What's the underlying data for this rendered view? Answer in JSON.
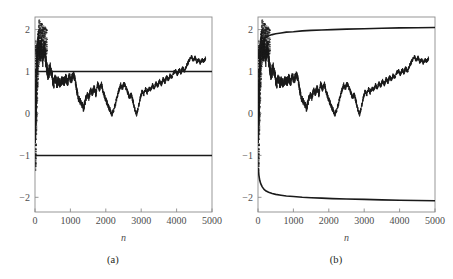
{
  "figure": {
    "background_color": "#ffffff",
    "panels": [
      {
        "id": "a",
        "caption": "(a)"
      },
      {
        "id": "b",
        "caption": "(b)"
      }
    ]
  },
  "chart_data": [
    {
      "type": "line",
      "panel": "a",
      "title": "",
      "xlabel": "n",
      "ylabel": "",
      "xlim": [
        0,
        5000
      ],
      "ylim": [
        -2.35,
        2.3
      ],
      "xticks": [
        0,
        1000,
        2000,
        3000,
        4000,
        5000
      ],
      "xticklabels": [
        "0",
        "1000",
        "2000",
        "3000",
        "4000",
        "5000"
      ],
      "yticks": [
        -2,
        -1,
        0,
        1,
        2
      ],
      "yticklabels": [
        "-2",
        "-1",
        "0",
        "1",
        "2"
      ],
      "grid": false,
      "legend": null,
      "series": [
        {
          "name": "sample-path",
          "style": "noisy-walk",
          "color": "#1a1a1a",
          "x": [
            10,
            30,
            60,
            100,
            140,
            180,
            220,
            260,
            300,
            340,
            380,
            420,
            470,
            520,
            570,
            620,
            670,
            720,
            770,
            820,
            870,
            920,
            970,
            1020,
            1070,
            1120,
            1170,
            1220,
            1270,
            1320,
            1370,
            1420,
            1470,
            1520,
            1570,
            1620,
            1670,
            1720,
            1770,
            1820,
            1870,
            1920,
            1970,
            2020,
            2070,
            2120,
            2170,
            2220,
            2270,
            2320,
            2370,
            2420,
            2470,
            2520,
            2570,
            2620,
            2670,
            2720,
            2770,
            2820,
            2870,
            2920,
            2970,
            3020,
            3070,
            3120,
            3170,
            3220,
            3270,
            3320,
            3370,
            3420,
            3470,
            3520,
            3570,
            3620,
            3670,
            3720,
            3770,
            3820,
            3870,
            3920,
            3970,
            4020,
            4070,
            4120,
            4170,
            4220,
            4270,
            4320,
            4370,
            4420,
            4470,
            4520,
            4570,
            4620,
            4670,
            4720,
            4770,
            4820
          ],
          "y": [
            0.05,
            0.55,
            1.35,
            1.72,
            1.45,
            1.62,
            1.28,
            1.55,
            1.3,
            1.05,
            0.88,
            1.12,
            0.95,
            0.7,
            0.8,
            0.72,
            0.78,
            0.7,
            0.82,
            0.75,
            0.86,
            0.74,
            0.9,
            0.78,
            0.92,
            0.86,
            0.6,
            0.38,
            0.3,
            0.22,
            0.12,
            0.3,
            0.45,
            0.38,
            0.55,
            0.48,
            0.62,
            0.45,
            0.7,
            0.58,
            0.72,
            0.55,
            0.4,
            0.28,
            0.18,
            0.08,
            -0.02,
            0.06,
            0.22,
            0.4,
            0.55,
            0.68,
            0.6,
            0.72,
            0.62,
            0.5,
            0.38,
            0.45,
            0.28,
            0.1,
            -0.02,
            0.15,
            0.35,
            0.52,
            0.45,
            0.58,
            0.5,
            0.62,
            0.55,
            0.68,
            0.6,
            0.72,
            0.65,
            0.78,
            0.7,
            0.82,
            0.75,
            0.88,
            0.8,
            0.92,
            0.85,
            0.98,
            1.02,
            0.92,
            1.05,
            0.96,
            1.08,
            1.0,
            1.12,
            1.2,
            1.28,
            1.35,
            1.26,
            1.34,
            1.22,
            1.3,
            1.2,
            1.28,
            1.24,
            1.32
          ]
        },
        {
          "name": "upper-bound-line",
          "style": "horizontal",
          "value": 1.0,
          "color": "#1a1a1a"
        },
        {
          "name": "lower-bound-line",
          "style": "horizontal",
          "value": -1.0,
          "color": "#1a1a1a"
        }
      ]
    },
    {
      "type": "line",
      "panel": "b",
      "title": "",
      "xlabel": "n",
      "ylabel": "",
      "xlim": [
        0,
        5000
      ],
      "ylim": [
        -2.35,
        2.3
      ],
      "xticks": [
        0,
        1000,
        2000,
        3000,
        4000,
        5000
      ],
      "xticklabels": [
        "0",
        "1000",
        "2000",
        "3000",
        "4000",
        "5000"
      ],
      "yticks": [
        -2,
        -1,
        0,
        1,
        2
      ],
      "yticklabels": [
        "-2",
        "-1",
        "0",
        "1",
        "2"
      ],
      "grid": false,
      "legend": null,
      "series": [
        {
          "name": "sample-path",
          "style": "noisy-walk",
          "color": "#1a1a1a",
          "x": [
            10,
            30,
            60,
            100,
            140,
            180,
            220,
            260,
            300,
            340,
            380,
            420,
            470,
            520,
            570,
            620,
            670,
            720,
            770,
            820,
            870,
            920,
            970,
            1020,
            1070,
            1120,
            1170,
            1220,
            1270,
            1320,
            1370,
            1420,
            1470,
            1520,
            1570,
            1620,
            1670,
            1720,
            1770,
            1820,
            1870,
            1920,
            1970,
            2020,
            2070,
            2120,
            2170,
            2220,
            2270,
            2320,
            2370,
            2420,
            2470,
            2520,
            2570,
            2620,
            2670,
            2720,
            2770,
            2820,
            2870,
            2920,
            2970,
            3020,
            3070,
            3120,
            3170,
            3220,
            3270,
            3320,
            3370,
            3420,
            3470,
            3520,
            3570,
            3620,
            3670,
            3720,
            3770,
            3820,
            3870,
            3920,
            3970,
            4020,
            4070,
            4120,
            4170,
            4220,
            4270,
            4320,
            4370,
            4420,
            4470,
            4520,
            4570,
            4620,
            4670,
            4720,
            4770,
            4820
          ],
          "y": [
            0.05,
            0.55,
            1.35,
            1.72,
            1.45,
            1.62,
            1.28,
            1.55,
            1.3,
            1.05,
            0.88,
            1.12,
            0.95,
            0.7,
            0.8,
            0.72,
            0.78,
            0.7,
            0.82,
            0.75,
            0.86,
            0.74,
            0.9,
            0.78,
            0.92,
            0.86,
            0.6,
            0.38,
            0.3,
            0.22,
            0.12,
            0.3,
            0.45,
            0.38,
            0.55,
            0.48,
            0.62,
            0.45,
            0.7,
            0.58,
            0.72,
            0.55,
            0.4,
            0.28,
            0.18,
            0.08,
            -0.02,
            0.06,
            0.22,
            0.4,
            0.55,
            0.68,
            0.6,
            0.72,
            0.62,
            0.5,
            0.38,
            0.45,
            0.28,
            0.1,
            -0.02,
            0.15,
            0.35,
            0.52,
            0.45,
            0.58,
            0.5,
            0.62,
            0.55,
            0.68,
            0.6,
            0.72,
            0.65,
            0.78,
            0.7,
            0.82,
            0.75,
            0.88,
            0.8,
            0.92,
            0.85,
            0.98,
            1.02,
            0.92,
            1.05,
            0.96,
            1.08,
            1.0,
            1.12,
            1.2,
            1.28,
            1.35,
            1.26,
            1.34,
            1.22,
            1.3,
            1.2,
            1.28,
            1.24,
            1.32
          ]
        },
        {
          "name": "upper-envelope",
          "style": "curve",
          "color": "#1a1a1a",
          "description": "increasing concave curve rising from about 1.30 at small n to about 2.05 at n=5000",
          "x": [
            10,
            25,
            50,
            80,
            120,
            170,
            230,
            300,
            400,
            500,
            650,
            800,
            1000,
            1250,
            1500,
            1800,
            2100,
            2500,
            3000,
            3500,
            4000,
            4500,
            5000
          ],
          "y": [
            1.3,
            1.45,
            1.58,
            1.66,
            1.72,
            1.78,
            1.82,
            1.85,
            1.88,
            1.9,
            1.92,
            1.94,
            1.95,
            1.97,
            1.98,
            1.99,
            2.0,
            2.01,
            2.02,
            2.03,
            2.04,
            2.045,
            2.05
          ]
        },
        {
          "name": "lower-envelope",
          "style": "curve",
          "color": "#1a1a1a",
          "description": "decreasing convex curve falling from about -1.30 at small n to about -2.08 at n=5000",
          "x": [
            10,
            25,
            50,
            80,
            120,
            170,
            230,
            300,
            400,
            500,
            650,
            800,
            1000,
            1250,
            1500,
            1800,
            2100,
            2500,
            3000,
            3500,
            4000,
            4500,
            5000
          ],
          "y": [
            -1.3,
            -1.47,
            -1.6,
            -1.68,
            -1.75,
            -1.81,
            -1.85,
            -1.88,
            -1.91,
            -1.93,
            -1.95,
            -1.97,
            -1.98,
            -2.0,
            -2.01,
            -2.02,
            -2.03,
            -2.04,
            -2.05,
            -2.06,
            -2.07,
            -2.075,
            -2.08
          ]
        }
      ]
    }
  ]
}
